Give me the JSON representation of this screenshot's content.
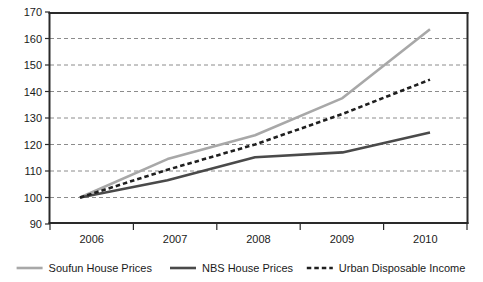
{
  "chart_data": {
    "type": "line",
    "title": "",
    "subtitle": "",
    "xlabel": "",
    "ylabel": "",
    "x": [
      2006,
      2007,
      2008,
      2009,
      2010
    ],
    "categories": [
      "2006",
      "2007",
      "2008",
      "2009",
      "2010"
    ],
    "xtick_labels": [
      "2006",
      "2007",
      "2008",
      "2009",
      "2010"
    ],
    "ytick_labels": [
      "170",
      "160",
      "150",
      "140",
      "130",
      "120",
      "110",
      "100",
      "90"
    ],
    "ytick_values": [
      170,
      160,
      150,
      140,
      130,
      120,
      110,
      100,
      90
    ],
    "ylim": [
      90,
      170
    ],
    "xlim": [
      2006,
      2010
    ],
    "grid": "horizontal-dashed",
    "legend_position": "bottom",
    "series": [
      {
        "name": "Soufun House Prices",
        "values": [
          100,
          114.5,
          123.5,
          137.5,
          163.5
        ],
        "color": "#a8a8a8",
        "style": "solid",
        "width": 2.6
      },
      {
        "name": "NBS House Prices",
        "values": [
          100,
          106.5,
          115.2,
          117,
          124.5
        ],
        "color": "#4a4a4a",
        "style": "solid",
        "width": 2.6
      },
      {
        "name": "Urban Disposable Income",
        "values": [
          100,
          110.5,
          120,
          131.5,
          144.5
        ],
        "color": "#1f1f1f",
        "style": "dashed",
        "width": 2.6
      }
    ]
  },
  "axis": {
    "y_labels": [
      "170",
      "160",
      "150",
      "140",
      "130",
      "120",
      "110",
      "100",
      "90"
    ],
    "x_labels": [
      "2006",
      "2007",
      "2008",
      "2009",
      "2010"
    ]
  },
  "legend": {
    "items": [
      {
        "label": "Soufun House Prices",
        "swatch": "light-gray-solid-line"
      },
      {
        "label": "NBS House Prices",
        "swatch": "dark-gray-solid-line"
      },
      {
        "label": "Urban Disposable Income",
        "swatch": "black-dashed-line"
      }
    ]
  }
}
